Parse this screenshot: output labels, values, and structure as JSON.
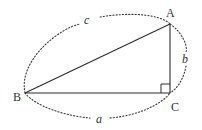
{
  "diagram": {
    "type": "right-triangle",
    "vertices": {
      "A": {
        "label": "A",
        "x": 170,
        "y": 24
      },
      "B": {
        "label": "B",
        "x": 25,
        "y": 93
      },
      "C": {
        "label": "C",
        "x": 170,
        "y": 93
      }
    },
    "sides": {
      "a": {
        "label": "a",
        "from": "B",
        "to": "C"
      },
      "b": {
        "label": "b",
        "from": "C",
        "to": "A"
      },
      "c": {
        "label": "c",
        "from": "B",
        "to": "A"
      }
    },
    "right_angle_at": "C",
    "colors": {
      "stroke": "#2b2b2b",
      "text": "#333333",
      "background": "#ffffff"
    }
  }
}
